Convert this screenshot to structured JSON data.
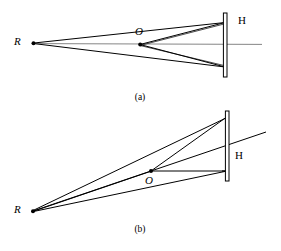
{
  "figure": {
    "panels": [
      {
        "id": "a",
        "caption": "(a)",
        "labels": {
          "source": "R",
          "object": "O",
          "plate": "H"
        },
        "geometry": {
          "R": [
            33,
            43
          ],
          "O": [
            140,
            44
          ],
          "plate_x": 225,
          "plate_top": 13,
          "plate_bottom": 77,
          "plate_width": 3.5,
          "ray_top_y": 23,
          "ray_bottom_y": 67,
          "axis_start_x": 140,
          "axis_end_x": 262,
          "axis_y": 44
        },
        "rays": [
          {
            "name": "R-to-plate-top",
            "from": "R",
            "to": "plate-top"
          },
          {
            "name": "R-to-plate-bottom",
            "from": "R",
            "to": "plate-bottom"
          },
          {
            "name": "O-to-plate-top",
            "from": "O",
            "to": "plate-top"
          },
          {
            "name": "O-to-plate-bottom",
            "from": "O",
            "to": "plate-bottom"
          },
          {
            "name": "R-to-O-axis",
            "from": "R",
            "to": "O"
          }
        ]
      },
      {
        "id": "b",
        "caption": "(b)",
        "labels": {
          "source": "R",
          "object": "O",
          "plate": "H"
        },
        "geometry": {
          "R": [
            32,
            211
          ],
          "O": [
            151,
            171
          ],
          "plate_x": 227,
          "plate_top": 111,
          "plate_bottom": 181,
          "plate_width": 3.5,
          "ray_top_y": 118,
          "ray_bottom_y": 171,
          "oblique_end": [
            266,
            132
          ]
        },
        "rays": [
          {
            "name": "R-to-plate-top",
            "from": "R",
            "to": "plate-top"
          },
          {
            "name": "R-through-O-extended",
            "from": "R",
            "to": "beyond-plate"
          },
          {
            "name": "R-to-plate-bottom",
            "from": "R",
            "to": "plate-bottom"
          },
          {
            "name": "O-to-plate-top",
            "from": "O",
            "to": "plate-top"
          },
          {
            "name": "O-to-plate-horizontal",
            "from": "O",
            "to": "plate-mid"
          }
        ]
      }
    ],
    "colors": {
      "ink": "#000000",
      "axis": "#555555",
      "background": "#ffffff"
    }
  }
}
